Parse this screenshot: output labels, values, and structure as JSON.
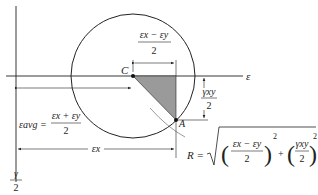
{
  "diagram": {
    "axes": {
      "horizontal_label": "ε",
      "vertical_label_num": "γ",
      "vertical_label_den": "2"
    },
    "points": {
      "center": "C",
      "reference": "A"
    },
    "labels": {
      "half_diff_num": "εx − εy",
      "half_diff_den": "2",
      "shear_num": "γxy",
      "shear_den": "2",
      "avg_lhs": "εavg =",
      "avg_num": "εx + εy",
      "avg_den": "2",
      "ex_dim": "εx",
      "radius_lhs": "R =",
      "radius_term1_num": "εx − εy",
      "radius_term1_den": "2",
      "radius_term2_num": "γxy",
      "radius_term2_den": "2",
      "plus": "+",
      "exp": "2"
    },
    "colors": {
      "line": "#222222",
      "shade": "#9a9a9a"
    }
  }
}
